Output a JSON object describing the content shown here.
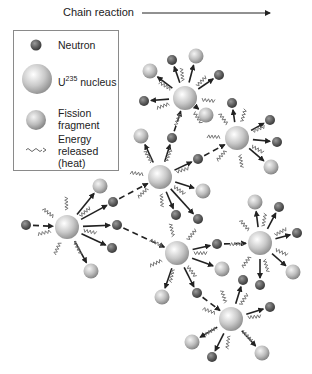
{
  "title": "Chain reaction",
  "legend": {
    "neutron": "Neutron",
    "nucleus_prefix": "U",
    "nucleus_sup": "235",
    "nucleus_suffix": " nucleus",
    "fragment_line1": "Fission",
    "fragment_line2": "fragment",
    "energy_line1": "Energy",
    "energy_line2": "released",
    "energy_line3": "(heat)"
  },
  "colors": {
    "neutron": "#5a5a5a",
    "nucleus": "#c8c8c8",
    "fragment": "#bdbdbd",
    "arrow": "#222222",
    "heat": "#777777"
  },
  "nuclei": [
    {
      "id": "n0",
      "x": 67,
      "y": 227
    },
    {
      "id": "n1",
      "x": 160,
      "y": 177
    },
    {
      "id": "n2",
      "x": 185,
      "y": 98
    },
    {
      "id": "n3",
      "x": 237,
      "y": 138
    },
    {
      "id": "n4",
      "x": 177,
      "y": 253
    },
    {
      "id": "n5",
      "x": 260,
      "y": 243
    },
    {
      "id": "n6",
      "x": 231,
      "y": 319
    }
  ],
  "particles": [
    {
      "from": "n0",
      "type": "neutron",
      "x": 26,
      "y": 225,
      "incoming": true
    },
    {
      "from": "n0",
      "type": "fragment",
      "x": 100,
      "y": 186
    },
    {
      "from": "n0",
      "type": "neutron",
      "x": 113,
      "y": 202
    },
    {
      "from": "n0",
      "type": "neutron",
      "x": 117,
      "y": 225
    },
    {
      "from": "n0",
      "type": "neutron",
      "x": 112,
      "y": 248
    },
    {
      "from": "n0",
      "type": "fragment",
      "x": 91,
      "y": 271
    },
    {
      "from": "n1",
      "type": "fragment",
      "x": 141,
      "y": 136
    },
    {
      "from": "n1",
      "type": "neutron",
      "x": 172,
      "y": 138
    },
    {
      "from": "n1",
      "type": "neutron",
      "x": 198,
      "y": 159
    },
    {
      "from": "n1",
      "type": "fragment",
      "x": 203,
      "y": 191
    },
    {
      "from": "n1",
      "type": "neutron",
      "x": 176,
      "y": 215
    },
    {
      "from": "n1",
      "type": "neutron",
      "x": 198,
      "y": 219
    },
    {
      "from": "n2",
      "type": "fragment",
      "x": 150,
      "y": 71
    },
    {
      "from": "n2",
      "type": "neutron",
      "x": 172,
      "y": 60
    },
    {
      "from": "n2",
      "type": "fragment",
      "x": 196,
      "y": 56
    },
    {
      "from": "n2",
      "type": "neutron",
      "x": 219,
      "y": 75
    },
    {
      "from": "n2",
      "type": "neutron",
      "x": 144,
      "y": 101
    },
    {
      "from": "n2",
      "type": "fragment",
      "x": 206,
      "y": 115
    },
    {
      "from": "n3",
      "type": "neutron",
      "x": 232,
      "y": 103
    },
    {
      "from": "n3",
      "type": "neutron",
      "x": 270,
      "y": 120
    },
    {
      "from": "n3",
      "type": "neutron",
      "x": 277,
      "y": 142
    },
    {
      "from": "n3",
      "type": "fragment",
      "x": 271,
      "y": 167
    },
    {
      "from": "n4",
      "type": "neutron",
      "x": 217,
      "y": 244
    },
    {
      "from": "n4",
      "type": "fragment",
      "x": 222,
      "y": 269
    },
    {
      "from": "n4",
      "type": "neutron",
      "x": 197,
      "y": 293
    },
    {
      "from": "n4",
      "type": "fragment",
      "x": 162,
      "y": 297
    },
    {
      "from": "n5",
      "type": "fragment",
      "x": 255,
      "y": 202
    },
    {
      "from": "n5",
      "type": "neutron",
      "x": 279,
      "y": 207
    },
    {
      "from": "n5",
      "type": "neutron",
      "x": 297,
      "y": 233
    },
    {
      "from": "n5",
      "type": "fragment",
      "x": 293,
      "y": 272
    },
    {
      "from": "n5",
      "type": "neutron",
      "x": 260,
      "y": 285
    },
    {
      "from": "n6",
      "type": "neutron",
      "x": 243,
      "y": 280
    },
    {
      "from": "n6",
      "type": "neutron",
      "x": 270,
      "y": 307
    },
    {
      "from": "n6",
      "type": "fragment",
      "x": 192,
      "y": 342
    },
    {
      "from": "n6",
      "type": "neutron",
      "x": 212,
      "y": 357
    },
    {
      "from": "n6",
      "type": "fragment",
      "x": 262,
      "y": 353
    }
  ],
  "links": [
    {
      "from": "n0",
      "to": "n1",
      "via": {
        "x": 113,
        "y": 202
      }
    },
    {
      "from": "n0",
      "to": "n4",
      "via": {
        "x": 117,
        "y": 225
      }
    },
    {
      "from": "n1",
      "to": "n3",
      "via": {
        "x": 198,
        "y": 159
      }
    },
    {
      "from": "n1",
      "to": "n2",
      "via": {
        "x": 172,
        "y": 138
      }
    },
    {
      "from": "n4",
      "to": "n5",
      "via": {
        "x": 217,
        "y": 244
      }
    },
    {
      "from": "n4",
      "to": "n6",
      "via": {
        "x": 197,
        "y": 293
      }
    }
  ]
}
